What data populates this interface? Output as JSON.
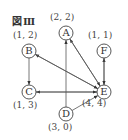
{
  "figure": {
    "title": "図Ⅲ"
  },
  "nodes": [
    {
      "id": "A",
      "label": "A",
      "coord": "(2, 2)",
      "x": 66,
      "y": 33
    },
    {
      "id": "B",
      "label": "B",
      "coord": "(1, 2)",
      "x": 29,
      "y": 51
    },
    {
      "id": "C",
      "label": "C",
      "coord": "(1, 3)",
      "x": 29,
      "y": 92
    },
    {
      "id": "D",
      "label": "D",
      "coord": "(3, 0)",
      "x": 66,
      "y": 114
    },
    {
      "id": "E",
      "label": "E",
      "coord": "(4, 4)",
      "x": 104,
      "y": 92
    },
    {
      "id": "F",
      "label": "F",
      "coord": "(1, 1)",
      "x": 104,
      "y": 51
    }
  ],
  "edges": [
    {
      "from": "B",
      "to": "C"
    },
    {
      "from": "E",
      "to": "B"
    },
    {
      "from": "E",
      "to": "C"
    },
    {
      "from": "C",
      "to": "E"
    },
    {
      "from": "E",
      "to": "A"
    },
    {
      "from": "E",
      "to": "F"
    },
    {
      "from": "F",
      "to": "E"
    },
    {
      "from": "D",
      "to": "A"
    },
    {
      "from": "D",
      "to": "E"
    },
    {
      "from": "A",
      "to": "E"
    },
    {
      "from": "B",
      "to": "E"
    }
  ]
}
